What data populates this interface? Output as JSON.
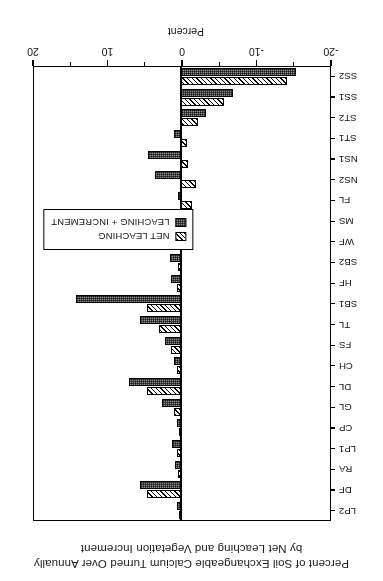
{
  "chart": {
    "title_line1": "Percent of Soil Exchangeable Calcium Turned Over Annually",
    "title_line2": "by Net Leaching and Vegetation Increment",
    "value_axis_name": "Percent",
    "legend": {
      "net_label": "NET LEACHING",
      "inc_label": "LEACHING + INCREMENT",
      "net_swatch": "diagonal-hatch-pattern",
      "inc_swatch": "dark-dotted-pattern"
    }
  },
  "chart_data": {
    "type": "bar",
    "orientation": "horizontal",
    "title": "Percent of Soil Exchangeable Calcium Turned Over Annually by Net Leaching and Vegetation Increment",
    "xlabel": "Percent",
    "ylabel": "",
    "xlim": [
      -20,
      20
    ],
    "xticks": [
      20,
      10,
      0,
      -10,
      -20
    ],
    "xtick_labels": [
      "20",
      "10",
      "0",
      "-10",
      "-20"
    ],
    "minor_xticks": [
      15,
      5,
      -5,
      -15
    ],
    "grid": false,
    "legend_position": "inside-left",
    "categories": [
      "LP2",
      "DF",
      "RA",
      "LP1",
      "CP",
      "GL",
      "DL",
      "CH",
      "FS",
      "TL",
      "SB1",
      "HF",
      "SB2",
      "WF",
      "MS",
      "FL",
      "NS2",
      "NS1",
      "ST1",
      "ST2",
      "SS1",
      "SS2"
    ],
    "series": [
      {
        "name": "NET LEACHING",
        "pattern": "diagonal-hatch",
        "values": [
          0.3,
          4.5,
          0.4,
          0.6,
          0.2,
          1.0,
          4.5,
          0.5,
          1.3,
          3.0,
          4.5,
          0.5,
          0.4,
          2.0,
          0.6,
          -1.5,
          -2.0,
          -1.0,
          -0.8,
          -2.3,
          -5.8,
          -14.2
        ]
      },
      {
        "name": "LEACHING + INCREMENT",
        "pattern": "dark-dotted",
        "values": [
          0.5,
          5.5,
          0.8,
          1.2,
          0.6,
          2.5,
          7.0,
          1.0,
          2.2,
          5.5,
          14.1,
          1.3,
          1.5,
          4.0,
          1.2,
          0.4,
          3.5,
          4.4,
          1.0,
          -3.3,
          -7.0,
          -15.4
        ]
      }
    ]
  }
}
